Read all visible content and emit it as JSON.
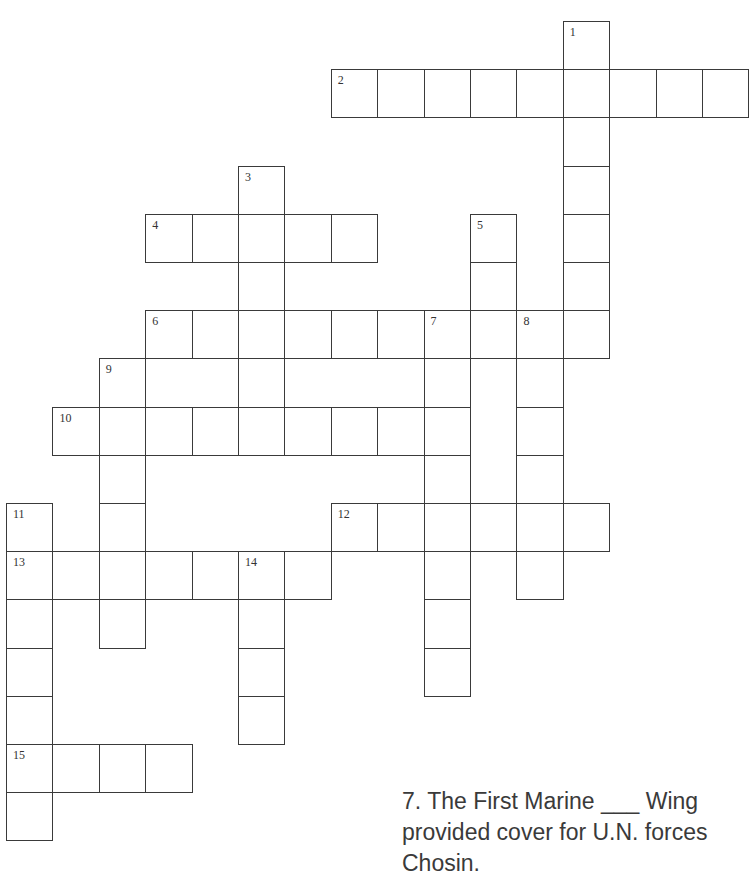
{
  "puzzle": {
    "layout": {
      "origin_x": 6,
      "origin_y": 21,
      "cell_w": 46.4,
      "cell_h": 48.2
    },
    "entries": [
      {
        "number": "1",
        "direction": "down",
        "row": 0,
        "col": 12,
        "length": 7
      },
      {
        "number": "2",
        "direction": "across",
        "row": 1,
        "col": 7,
        "length": 9
      },
      {
        "number": "3",
        "direction": "down",
        "row": 3,
        "col": 5,
        "length": 5
      },
      {
        "number": "4",
        "direction": "across",
        "row": 4,
        "col": 3,
        "length": 5
      },
      {
        "number": "5",
        "direction": "down",
        "row": 4,
        "col": 10,
        "length": 3
      },
      {
        "number": "6",
        "direction": "across",
        "row": 6,
        "col": 3,
        "length": 10
      },
      {
        "number": "7",
        "direction": "down",
        "row": 6,
        "col": 9,
        "length": 8
      },
      {
        "number": "8",
        "direction": "down",
        "row": 6,
        "col": 11,
        "length": 6
      },
      {
        "number": "9",
        "direction": "down",
        "row": 7,
        "col": 2,
        "length": 6
      },
      {
        "number": "10",
        "direction": "across",
        "row": 8,
        "col": 1,
        "length": 9
      },
      {
        "number": "11",
        "direction": "down",
        "row": 10,
        "col": 0,
        "length": 7
      },
      {
        "number": "12",
        "direction": "across",
        "row": 10,
        "col": 7,
        "length": 6
      },
      {
        "number": "13",
        "direction": "across",
        "row": 11,
        "col": 0,
        "length": 7
      },
      {
        "number": "14",
        "direction": "down",
        "row": 11,
        "col": 5,
        "length": 4
      },
      {
        "number": "15",
        "direction": "across",
        "row": 15,
        "col": 0,
        "length": 4
      }
    ]
  },
  "clue_text": {
    "line1": "7.  The First Marine ___ Wing",
    "line2": "provided cover for U.N. forces",
    "line3": "Chosin."
  }
}
